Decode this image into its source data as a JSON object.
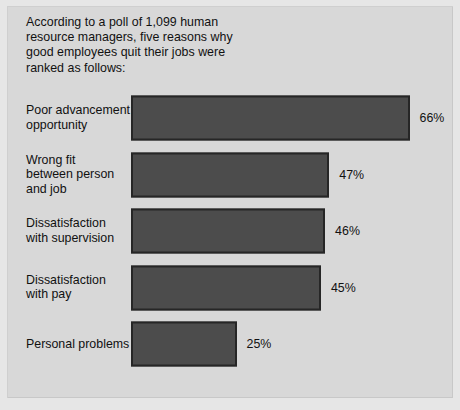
{
  "caption": "According to a poll of 1,099 human\nresource managers, five reasons why\ngood employees quit their jobs were\nranked as follows:",
  "colors": {
    "background": "#d8d8d8",
    "outer": "#e6e6e6",
    "bar_fill": "#4c4c4c",
    "bar_border": "#262626",
    "text": "#111111"
  },
  "chart_data": {
    "type": "bar",
    "orientation": "horizontal",
    "title": "According to a poll of 1,099 human resource managers, five reasons why good employees quit their jobs were ranked as follows:",
    "xlabel": "",
    "ylabel": "",
    "xlim": [
      0,
      70
    ],
    "grid": false,
    "legend": null,
    "unit": "%",
    "categories": [
      "Poor advancement\nopportunity",
      "Wrong fit\nbetween person\nand job",
      "Dissatisfaction\nwith supervision",
      "Dissatisfaction\nwith pay",
      "Personal problems"
    ],
    "values": [
      66,
      47,
      46,
      45,
      25
    ],
    "data_labels": [
      "66%",
      "47%",
      "46%",
      "45%",
      "25%"
    ]
  },
  "rows": [
    {
      "label": "Poor advancement\nopportunity",
      "value": 66,
      "data_label": "66%"
    },
    {
      "label": "Wrong fit\nbetween person\nand job",
      "value": 47,
      "data_label": "47%"
    },
    {
      "label": "Dissatisfaction\nwith supervision",
      "value": 46,
      "data_label": "46%"
    },
    {
      "label": "Dissatisfaction\nwith pay",
      "value": 45,
      "data_label": "45%"
    },
    {
      "label": "Personal problems",
      "value": 25,
      "data_label": "25%"
    }
  ]
}
